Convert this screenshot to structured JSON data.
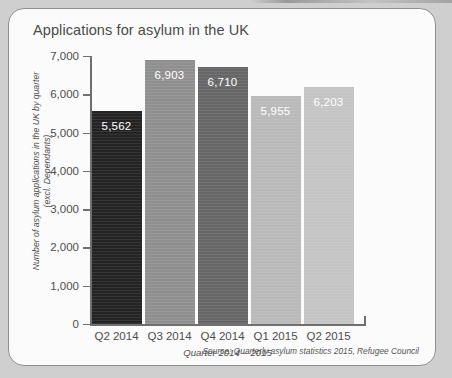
{
  "card": {
    "title": "Applications for asylum in the UK",
    "source": "Source: Quarterly asylum statistics 2015, Refugee Council"
  },
  "axis": {
    "y_title_line1": "Number of asylum applications in the UK by quarter",
    "y_title_line2": "(excl. Dependants)",
    "x_title": "Quarter 2014 – 2015"
  },
  "chart_data": {
    "type": "bar",
    "title": "Applications for asylum in the UK",
    "xlabel": "Quarter 2014 – 2015",
    "ylabel": "Number of asylum applications in the UK by quarter (excl. Dependants)",
    "categories": [
      "Q2 2014",
      "Q3 2014",
      "Q4 2014",
      "Q1 2015",
      "Q2 2015"
    ],
    "values": [
      5562,
      6903,
      6710,
      5955,
      6203
    ],
    "value_labels": [
      "5,562",
      "6,903",
      "6,710",
      "5,955",
      "6,203"
    ],
    "colors": [
      "#232323",
      "#8f8f8f",
      "#666666",
      "#b9b9b9",
      "#c4c4c4"
    ],
    "ylim": [
      0,
      7000
    ],
    "ytick_values": [
      0,
      1000,
      2000,
      3000,
      4000,
      5000,
      6000,
      7000
    ],
    "ytick_labels": [
      "0",
      "1,000",
      "2,000",
      "3,000",
      "4,000",
      "5,000",
      "6,000",
      "7,000"
    ],
    "grid": false,
    "legend": "none",
    "source": "Source: Quarterly asylum statistics 2015, Refugee Council"
  }
}
